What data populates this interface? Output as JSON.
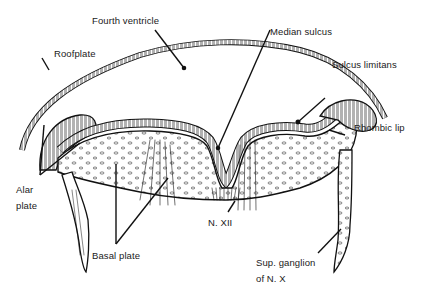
{
  "figure": {
    "type": "anatomical cross-section",
    "labels": {
      "fourth_ventricle": "Fourth ventricle",
      "median_sulcus": "Median sulcus",
      "roofplate": "Roofplate",
      "sulcus_limitans": "Sulcus limitans",
      "rhombic_lip": "Rhombic lip",
      "alar_plate_line1": "Alar",
      "alar_plate_line2": "plate",
      "basal_plate": "Basal plate",
      "n_xii": "N. XII",
      "sup_ganglion_line1": "Sup. ganglion",
      "sup_ganglion_line2": "of N. X"
    },
    "colors": {
      "ink": "#111111",
      "background": "#ffffff"
    }
  }
}
